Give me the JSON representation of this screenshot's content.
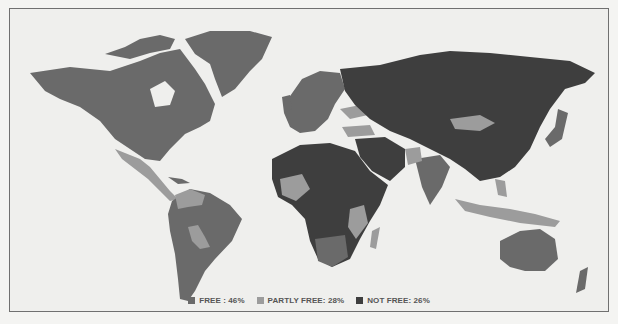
{
  "map": {
    "type": "choropleth-world",
    "colors": {
      "free": "#6a6a6a",
      "partly_free": "#9c9c9c",
      "not_free": "#3e3e3e",
      "ocean": "#efefed"
    }
  },
  "legend": [
    {
      "key": "free",
      "label": "FREE : 46%"
    },
    {
      "key": "partly_free",
      "label": "PARTLY FREE: 28%"
    },
    {
      "key": "not_free",
      "label": "NOT FREE: 26%"
    }
  ]
}
